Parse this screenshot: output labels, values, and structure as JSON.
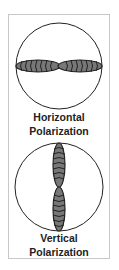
{
  "diagrams": [
    {
      "id": "horizontal",
      "title_line1": "Horizontal",
      "title_line2": "Polarization",
      "orientation": "horizontal"
    },
    {
      "id": "vertical",
      "title_line1": "Vertical",
      "title_line2": "Polarization",
      "orientation": "vertical"
    }
  ],
  "colors": {
    "lobe_fill": "#777777",
    "lobe_stroke": "#222222",
    "circle": "#222222",
    "frame": "#c8c8c8"
  }
}
